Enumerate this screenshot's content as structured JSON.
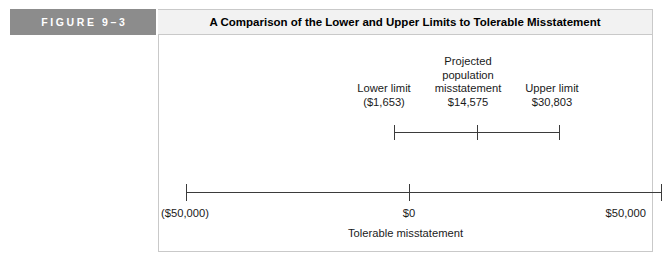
{
  "figure": {
    "number_label": "FIGURE 9–3",
    "title": "A Comparison of the Lower and Upper Limits to Tolerable Misstatement",
    "badge_color": "#8c8c8c",
    "title_bar_color": "#f2f2f2"
  },
  "chart_data": {
    "type": "line",
    "title": "A Comparison of the Lower and Upper Limits to Tolerable Misstatement",
    "xlabel": "Tolerable misstatement",
    "ylabel": "",
    "xlim": [
      -50000,
      50000
    ],
    "grid": false,
    "legend": "none",
    "axis": {
      "ticks": [
        {
          "name": "min",
          "value": -50000,
          "label": "($50,000)"
        },
        {
          "name": "zero",
          "value": 0,
          "label": "$0"
        },
        {
          "name": "max",
          "value": 50000,
          "label": "$50,000"
        }
      ]
    },
    "interval": {
      "lower_limit": {
        "value": -1653,
        "label_lines": [
          "Lower limit",
          "($1,653)"
        ],
        "name_line": "Lower limit",
        "value_line": "($1,653)"
      },
      "point_estimate": {
        "value": 14575,
        "label_lines": [
          "Projected",
          "population",
          "misstatement",
          "$14,575"
        ],
        "name_line_1": "Projected",
        "name_line_2": "population",
        "name_line_3": "misstatement",
        "value_line": "$14,575"
      },
      "upper_limit": {
        "value": 30803,
        "label_lines": [
          "Upper limit",
          "$30,803"
        ],
        "name_line": "Upper limit",
        "value_line": "$30,803"
      }
    }
  }
}
